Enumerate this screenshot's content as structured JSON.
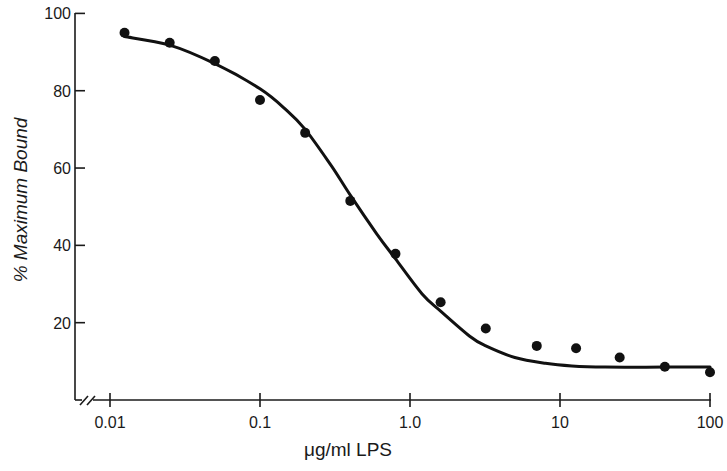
{
  "chart_data": {
    "type": "scatter",
    "title": "",
    "xlabel": "μg/ml LPS",
    "ylabel": "% Maximum Bound",
    "xscale": "log",
    "xlim": [
      0.01,
      100
    ],
    "ylim": [
      0,
      100
    ],
    "grid": false,
    "legend": null,
    "x_axis_break": true,
    "x_ticks": [
      {
        "value": 0.01,
        "label": "0.01"
      },
      {
        "value": 0.1,
        "label": "0.1"
      },
      {
        "value": 1,
        "label": "1.0"
      },
      {
        "value": 10,
        "label": "10"
      },
      {
        "value": 100,
        "label": "100"
      }
    ],
    "y_ticks": [
      {
        "value": 20,
        "label": "20"
      },
      {
        "value": 40,
        "label": "40"
      },
      {
        "value": 60,
        "label": "60"
      },
      {
        "value": 80,
        "label": "80"
      },
      {
        "value": 100,
        "label": "100"
      }
    ],
    "series": [
      {
        "name": "Measured binding",
        "kind": "points",
        "x": [
          0.0125,
          0.025,
          0.05,
          0.1,
          0.2,
          0.4,
          0.8,
          1.6,
          3.2,
          7.0,
          12.8,
          25,
          50,
          100
        ],
        "y": [
          95.0,
          92.4,
          87.7,
          77.6,
          69.1,
          51.5,
          37.8,
          25.3,
          18.5,
          14.0,
          13.4,
          11.0,
          8.6,
          7.2
        ]
      },
      {
        "name": "Fitted curve",
        "kind": "line",
        "x": [
          0.0125,
          0.025,
          0.05,
          0.1,
          0.15,
          0.2,
          0.3,
          0.4,
          0.6,
          0.8,
          1.2,
          1.6,
          2.5,
          3.2,
          5,
          8,
          12,
          20,
          50,
          100
        ],
        "y": [
          94.0,
          91.8,
          87.0,
          80.5,
          75.0,
          70.0,
          60.5,
          53.0,
          43.0,
          36.5,
          27.5,
          23.0,
          16.5,
          14.0,
          11.0,
          9.5,
          8.8,
          8.5,
          8.5,
          8.5
        ]
      }
    ]
  },
  "colors": {
    "ink": "#111111",
    "background": "#ffffff"
  }
}
